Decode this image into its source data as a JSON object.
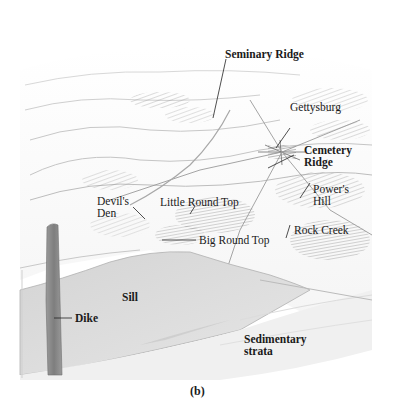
{
  "figure": {
    "caption": "(b)",
    "colors": {
      "background": "#ffffff",
      "sill": "#d9d9d9",
      "dike": "#8c8c8c",
      "strata_light": "#eeeeee",
      "ink": "#1a1a1a"
    }
  },
  "labels": {
    "seminary_ridge": "Seminary Ridge",
    "gettysburg": "Gettysburg",
    "cemetery_ridge": "Cemetery\nRidge",
    "devils_den": "Devil's\nDen",
    "little_round_top": "Little Round Top",
    "powers_hill": "Power's\nHill",
    "big_round_top": "Big Round Top",
    "rock_creek": "Rock Creek",
    "sill": "Sill",
    "dike": "Dike",
    "sedimentary_strata": "Sedimentary\nstrata"
  }
}
